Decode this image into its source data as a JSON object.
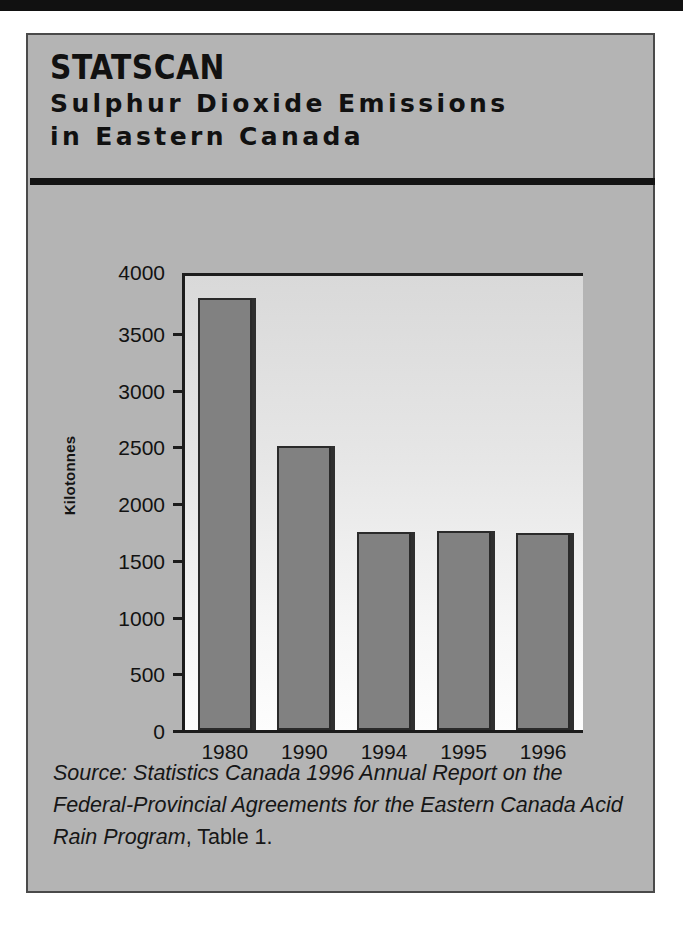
{
  "header": {
    "brand": "StatScan",
    "title_line_1": "Sulphur Dioxide Emissions",
    "title_line_2": "in Eastern Canada"
  },
  "caption": {
    "italic_text": "Source: Statistics Canada 1996 Annual Report on the Federal-Provincial Agreements for the Eastern Canada Acid Rain Program",
    "roman_text": ", Table 1."
  },
  "chart_data": {
    "type": "bar",
    "title": "Sulphur Dioxide Emissions in Eastern Canada",
    "categories": [
      "1980",
      "1990",
      "1994",
      "1995",
      "1996"
    ],
    "values": [
      3806,
      2502,
      1745,
      1753,
      1736
    ],
    "xlabel": "",
    "ylabel": "Kilotonnes",
    "ylim": [
      0,
      4000
    ],
    "ytick_values": [
      0,
      500,
      1000,
      1500,
      2000,
      2500,
      3000,
      3500,
      4000
    ],
    "ytick_labels": [
      "0",
      "500",
      "1000",
      "1500",
      "2000",
      "2500",
      "3000",
      "3500",
      "4000"
    ],
    "grid": false,
    "legend": false,
    "bar_color": "#818181",
    "bar_border_color": "#2a2a2a",
    "axis_color": "#1c1c1c",
    "panel_color": "#b4b4b4"
  }
}
